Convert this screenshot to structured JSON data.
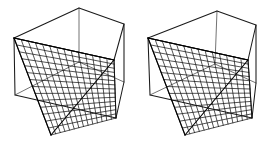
{
  "figure": {
    "subtitle": "Stereo pair — two ruled-surface views",
    "background_color": "#ffffff",
    "edge_color": "#1a1a1a",
    "hidden_edge_color": "#5a5a5a",
    "ruling_color": "#111111",
    "canvas": {
      "width": 261,
      "height": 151
    }
  },
  "chart_data": {
    "type": "diagram",
    "render": "wireframe-3d",
    "panel_count": 2,
    "ruling_families": 2,
    "rulings_per_family": 14,
    "panels": [
      {
        "name": "left-figure",
        "label": "Left eye view",
        "cube": {
          "front_top_left": [
            14,
            38
          ],
          "front_top_right": [
            114,
            60
          ],
          "front_bottom_right": [
            116,
            118
          ],
          "front_bottom_left": [
            15,
            95
          ],
          "back_top_left": [
            79,
            8
          ],
          "back_top_right": [
            124,
            24
          ],
          "back_bottom_right": [
            124,
            82
          ],
          "back_bottom_left": [
            79,
            62
          ]
        },
        "saddle": {
          "generator_edge_a": [
            [
              14,
              38
            ],
            [
              51,
              135
            ]
          ],
          "generator_edge_b": [
            [
              114,
              60
            ],
            [
              51,
              135
            ]
          ],
          "apex_vertex": [
            14,
            38
          ],
          "low_vertex": [
            51,
            135
          ],
          "right_vertex": [
            114,
            60
          ]
        }
      },
      {
        "name": "right-figure",
        "label": "Right eye view",
        "cube": {
          "front_top_left": [
            148,
            38
          ],
          "front_top_right": [
            248,
            60
          ],
          "front_bottom_right": [
            252,
            118
          ],
          "front_bottom_left": [
            150,
            95
          ],
          "back_top_left": [
            217,
            11
          ],
          "back_top_right": [
            256,
            25
          ],
          "back_bottom_right": [
            256,
            83
          ],
          "back_bottom_left": [
            215,
            64
          ]
        },
        "saddle": {
          "generator_edge_a": [
            [
              148,
              38
            ],
            [
              185,
              135
            ]
          ],
          "generator_edge_b": [
            [
              248,
              60
            ],
            [
              185,
              135
            ]
          ],
          "apex_vertex": [
            148,
            38
          ],
          "low_vertex": [
            185,
            135
          ],
          "right_vertex": [
            248,
            60
          ]
        }
      }
    ]
  }
}
